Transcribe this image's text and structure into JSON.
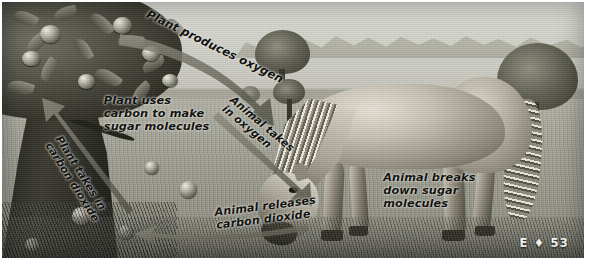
{
  "figure": {
    "page_marker": "E ♦ 53",
    "scene": {
      "plant_name": "apple-tree",
      "animal_name": "grazing-horse",
      "background_elements": [
        "sky",
        "mountains",
        "grass-field",
        "mid-trees",
        "fallen-apples"
      ]
    },
    "labels": [
      {
        "id": "plant-produces-oxygen",
        "text": "Plant produces oxygen"
      },
      {
        "id": "plant-uses-carbon",
        "text": "Plant uses\ncarbon to make\nsugar molecules"
      },
      {
        "id": "plant-takes-in-co2",
        "text": "Plant takes in\ncarbon dioxide"
      },
      {
        "id": "animal-takes-in-oxygen",
        "text": "Animal takes\nin oxygen"
      },
      {
        "id": "animal-releases-co2",
        "text": "Animal releases\ncarbon dioxide"
      },
      {
        "id": "animal-breaks-sugar",
        "text": "Animal breaks\ndown sugar\nmolecules"
      }
    ],
    "arrows": [
      {
        "id": "oxygen-arrow",
        "from": "plant",
        "to": "animal",
        "label": "Plant produces oxygen"
      },
      {
        "id": "carbon-dioxide-arrow",
        "from": "animal",
        "to": "plant",
        "label": "Plant takes in carbon dioxide"
      },
      {
        "id": "animal-intake-arrow",
        "from": "air",
        "to": "animal",
        "label": "Animal takes in oxygen"
      },
      {
        "id": "animal-release-arrow",
        "from": "animal",
        "to": "air",
        "label": "Animal releases carbon dioxide"
      }
    ],
    "colors": {
      "arrow_fill": "#6e6e62",
      "label_text": "#0d0d0a",
      "page_marker_text": "#ffffff",
      "field": "#9a9a8e",
      "sky": "#d6d6cf"
    }
  }
}
